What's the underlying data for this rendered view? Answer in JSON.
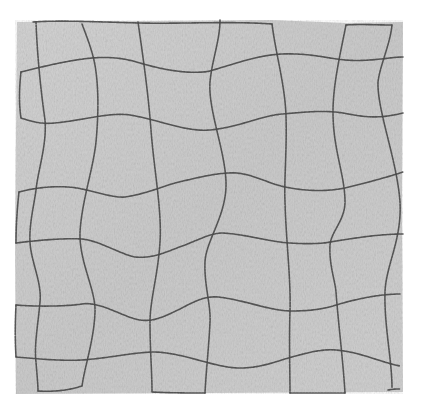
{
  "image": {
    "subject": "fabric-swatch-with-distorted-stitched-grid",
    "colors": {
      "background": "#ffffff",
      "fabric": "#c9c9c9",
      "fabric_light": "#d6d6d6",
      "fabric_dark": "#bdbdbd",
      "stitch": "#4a4a4a"
    },
    "swatch_bounds": {
      "x": 16,
      "y": 20,
      "width": 387,
      "height": 374
    },
    "grid": {
      "horizontal_lines": [
        {
          "id": "h-top-left",
          "d": "M 33 22 C 60 20, 100 22, 140 23 C 180 24, 230 21, 272 24"
        },
        {
          "id": "h-top-right",
          "d": "M 346 25 C 360 24, 378 25, 392 25"
        },
        {
          "id": "h1",
          "d": "M 21 72 C 45 66, 70 60, 92 58 C 115 56, 130 60, 140 63 C 170 72, 195 74, 210 71 C 240 62, 260 55, 282 54 C 310 53, 325 58, 345 60 C 370 62, 390 57, 403 57"
        },
        {
          "id": "h2",
          "d": "M 21 118 C 35 123, 45 124, 55 123 C 85 120, 110 112, 130 115 C 160 120, 185 132, 210 130 C 240 127, 260 116, 282 114 C 305 112, 325 110, 343 113 C 360 116, 375 120, 403 113"
        },
        {
          "id": "h3",
          "d": "M 19 192 C 45 185, 70 186, 82 189 C 100 193, 115 198, 125 197 C 145 194, 158 188, 175 183 C 200 177, 220 172, 237 173 C 255 175, 270 184, 285 187 C 310 192, 330 191, 345 188 C 365 183, 385 178, 403 172"
        },
        {
          "id": "h4",
          "d": "M 16 243 C 40 240, 65 238, 82 239 C 100 241, 120 254, 135 257 C 155 259, 170 250, 185 245 C 200 239, 212 233, 222 233 C 245 234, 270 242, 290 243 C 305 244, 320 244, 330 242 C 355 238, 380 234, 403 234"
        },
        {
          "id": "h5",
          "d": "M 16 305 C 40 307, 70 306, 82 304 C 100 301, 125 318, 140 320 C 155 322, 165 316, 180 309 C 195 301, 205 296, 218 297 C 245 300, 270 311, 292 311 C 310 311, 322 309, 333 306 C 355 299, 380 294, 400 294"
        },
        {
          "id": "h6",
          "d": "M 16 357 C 40 359, 60 361, 82 360 C 110 358, 135 352, 155 352 C 185 353, 215 368, 240 368 C 262 368, 280 360, 292 357 C 310 352, 322 349, 336 350 C 360 352, 380 362, 400 366"
        }
      ],
      "vertical_lines": [
        {
          "id": "v1",
          "d": "M 36 22 C 37 50, 40 85, 45 120 C 47 145, 38 170, 36 190 C 34 205, 29 225, 30 242 C 31 262, 42 282, 40 302 C 38 325, 34 345, 36 362 C 37 375, 38 385, 38 391"
        },
        {
          "id": "v2",
          "d": "M 82 24 C 88 40, 94 55, 96 72 C 99 95, 98 120, 96 142 C 93 170, 82 200, 80 232 C 79 262, 96 290, 95 312 C 94 340, 85 365, 82 386"
        },
        {
          "id": "v3",
          "d": "M 138 22 C 142 50, 148 90, 151 130 C 154 170, 162 210, 160 242 C 158 275, 150 300, 150 322 C 150 350, 152 372, 152 392"
        },
        {
          "id": "v4",
          "d": "M 220 20 C 220 40, 212 60, 210 82 C 208 110, 225 150, 226 182 C 227 215, 206 240, 205 262 C 204 285, 211 305, 210 322 C 209 345, 206 372, 205 393"
        },
        {
          "id": "v5",
          "d": "M 272 24 C 276 55, 285 85, 286 116 C 287 150, 284 180, 285 202 C 286 240, 291 280, 290 311 C 289 340, 290 372, 290 393"
        },
        {
          "id": "v6",
          "d": "M 346 25 C 340 55, 333 85, 333 112 C 333 150, 345 175, 345 202 C 345 220, 331 232, 330 245 C 329 265, 335 280, 336 292 C 338 320, 343 360, 345 393"
        },
        {
          "id": "v7",
          "d": "M 392 25 C 390 45, 380 65, 378 82 C 377 110, 397 160, 400 202 C 402 240, 386 265, 385 292 C 384 325, 392 360, 392 388"
        }
      ],
      "bottom_segments": [
        {
          "id": "b1",
          "d": "M 38 391 C 55 392, 70 390, 82 386"
        },
        {
          "id": "b2",
          "d": "M 152 392 C 172 393, 190 393, 205 393"
        },
        {
          "id": "b3",
          "d": "M 290 393 C 310 393, 330 393, 345 393"
        },
        {
          "id": "b4",
          "d": "M 388 390 C 393 389, 397 389, 400 389"
        }
      ],
      "left_edge_segments": [
        {
          "id": "l1",
          "d": "M 21 72 C 19 90, 19 105, 21 118"
        },
        {
          "id": "l2",
          "d": "M 19 192 C 17 210, 16 228, 16 243"
        },
        {
          "id": "l3",
          "d": "M 16 305 C 15 325, 15 340, 16 357"
        }
      ]
    }
  }
}
